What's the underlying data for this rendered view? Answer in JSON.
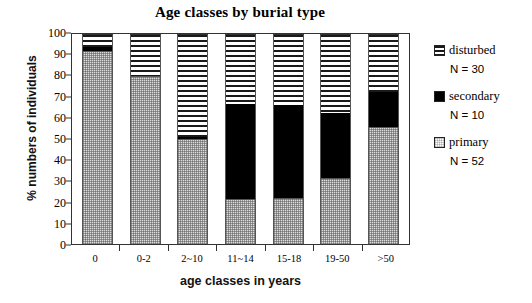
{
  "chart_data": {
    "type": "bar",
    "subtype": "stacked-percentage-column",
    "title": "Age classes by burial type",
    "xlabel": "age classes in years",
    "ylabel": "% numbers of individuals",
    "categories": [
      "0",
      "0-2",
      "2~10",
      "11~14",
      "15-18",
      "19-50",
      ">50"
    ],
    "ylim": [
      0,
      100
    ],
    "yticks": [
      0,
      10,
      20,
      30,
      40,
      50,
      60,
      70,
      80,
      90,
      100
    ],
    "grid": false,
    "legend_position": "right",
    "stack_order": [
      "primary",
      "secondary",
      "disturbed"
    ],
    "series": [
      {
        "name": "primary",
        "values": [
          92,
          80,
          50,
          21.5,
          22,
          31.5,
          55.5
        ]
      },
      {
        "name": "secondary",
        "values": [
          2,
          0,
          1,
          45,
          44,
          31,
          17
        ]
      },
      {
        "name": "disturbed",
        "values": [
          6,
          20,
          49,
          33.5,
          34,
          37.5,
          27.5
        ]
      }
    ]
  },
  "legend": {
    "items": [
      {
        "label": "disturbed",
        "n": "N = 30",
        "swatch": "hatch-horizontal-swatch",
        "color": "#1a1a1a"
      },
      {
        "label": "secondary",
        "n": "N = 10",
        "swatch": "solid-black-swatch",
        "color": "#000000"
      },
      {
        "label": "primary",
        "n": "N = 52",
        "swatch": "dotted-gray-swatch",
        "color": "#dddddd"
      }
    ]
  }
}
